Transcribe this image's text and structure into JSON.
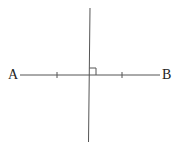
{
  "diagram": {
    "points": {
      "A": "A",
      "B": "B"
    },
    "colors": {
      "line": "#555555",
      "text": "#222222"
    }
  }
}
